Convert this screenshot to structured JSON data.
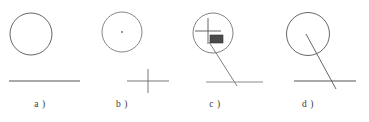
{
  "figure": {
    "type": "technical-line-drawing",
    "background_color": "#ffffff",
    "stroke_color": "#555555",
    "fill_color": "#3a3a3a",
    "width": 369,
    "height": 122,
    "panels": [
      {
        "id": "a",
        "label": "a )",
        "description": "circle above a horizontal line",
        "circle": {
          "cx": 31,
          "cy": 34,
          "r": 21
        },
        "baseline": {
          "x1": 9,
          "y1": 81,
          "x2": 80,
          "y2": 81
        },
        "center_dot": false,
        "cross": false,
        "rectangle": false,
        "leader_line": false
      },
      {
        "id": "b",
        "label": "b )",
        "description": "circle with center dot, separate cross marker below right",
        "circle": {
          "cx": 122,
          "cy": 32,
          "r": 20
        },
        "center_dot": {
          "cx": 122,
          "cy": 32,
          "r": 0.9
        },
        "cross": {
          "cx": 148,
          "cy": 81,
          "half_width": 21,
          "half_height": 12
        },
        "baseline": false,
        "rectangle": false,
        "leader_line": false
      },
      {
        "id": "c",
        "label": "c )",
        "description": "magnified circle containing a cross and a dark rectangle, leader line down to horizontal line",
        "circle": {
          "cx": 213,
          "cy": 33,
          "r": 20
        },
        "cross": {
          "cx": 208,
          "cy": 31,
          "half_width": 13,
          "half_height": 13
        },
        "rectangle": {
          "x": 210,
          "y": 35,
          "width": 13,
          "height": 8
        },
        "leader_line": {
          "x1": 209,
          "y1": 42,
          "x2": 237,
          "y2": 86
        },
        "baseline": {
          "x1": 206,
          "y1": 82,
          "x2": 263,
          "y2": 82
        },
        "center_dot": false
      },
      {
        "id": "d",
        "label": "d )",
        "description": "circle with a straight line from its center crossing down to a horizontal line",
        "circle": {
          "cx": 308,
          "cy": 34,
          "r": 21.5
        },
        "leader_line": {
          "x1": 306,
          "y1": 34,
          "x2": 336,
          "y2": 89
        },
        "baseline": {
          "x1": 294,
          "y1": 81,
          "x2": 356,
          "y2": 81
        },
        "center_dot": false,
        "cross": false,
        "rectangle": false
      }
    ]
  }
}
